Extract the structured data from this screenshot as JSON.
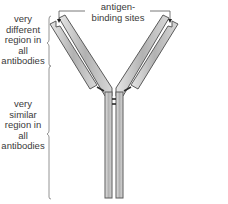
{
  "diagram": {
    "labels": {
      "antigen_binding_sites": [
        "antigen-",
        "binding sites"
      ],
      "variable_region": [
        "very",
        "different",
        "region in",
        "all",
        "antibodies"
      ],
      "constant_region": [
        "very",
        "similar",
        "region in",
        "all",
        "antibodies"
      ]
    },
    "components": {
      "heavy_chains": 2,
      "light_chains": 2,
      "antigen_binding_sites": 2,
      "hinge_disulfide_bonds": 2
    },
    "colors": {
      "chain_fill": "#b4b4b4",
      "chain_outline": "#5a5a5a",
      "bracket_line": "#7a7a7a",
      "text": "#3a3a3a",
      "bond": "#2a2a2a"
    }
  }
}
